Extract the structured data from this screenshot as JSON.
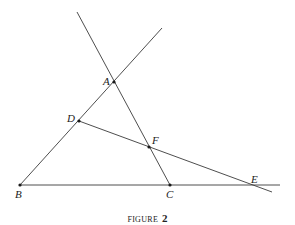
{
  "figure": {
    "caption_word": "FIGURE",
    "caption_number": "2",
    "stroke_color": "#3a3a3a",
    "points": [
      {
        "id": "A",
        "label": "A",
        "x": 114,
        "y": 82,
        "label_x": 103,
        "label_y": 85,
        "dot": true
      },
      {
        "id": "B",
        "label": "B",
        "x": 20,
        "y": 185,
        "label_x": 15,
        "label_y": 198,
        "dot": true
      },
      {
        "id": "C",
        "label": "C",
        "x": 170,
        "y": 185,
        "label_x": 166,
        "label_y": 198,
        "dot": true
      },
      {
        "id": "D",
        "label": "D",
        "x": 79,
        "y": 121,
        "label_x": 67,
        "label_y": 122,
        "dot": true
      },
      {
        "id": "E",
        "label": "E",
        "x": 252,
        "y": 185,
        "label_x": 251,
        "label_y": 183,
        "dot": false
      },
      {
        "id": "F",
        "label": "F",
        "x": 149,
        "y": 147,
        "label_x": 152,
        "label_y": 144,
        "dot": true
      }
    ],
    "lines": [
      {
        "id": "line-BA-extended",
        "description": "Line through B, D, A extended",
        "x1": 20,
        "y1": 185,
        "x2": 162,
        "y2": 28
      },
      {
        "id": "line-AC-extended",
        "description": "Line through A, F, C extended upward",
        "x1": 77,
        "y1": 12,
        "x2": 170,
        "y2": 185
      },
      {
        "id": "line-BE",
        "description": "Base line through B, C, E",
        "x1": 20,
        "y1": 185,
        "x2": 280,
        "y2": 185
      },
      {
        "id": "line-DE-extended",
        "description": "Transversal through D, F, E extended",
        "x1": 79,
        "y1": 121,
        "x2": 272,
        "y2": 192
      }
    ]
  }
}
